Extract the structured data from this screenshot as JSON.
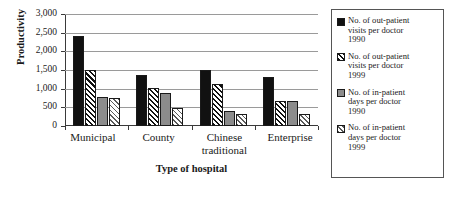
{
  "chart_data": {
    "type": "bar",
    "title": "",
    "xlabel": "Type of hospital",
    "ylabel": "Productivity",
    "categories": [
      "Municipal",
      "County",
      "Chinese traditional",
      "Enterprise"
    ],
    "category_lines": [
      [
        "Municipal"
      ],
      [
        "County"
      ],
      [
        "Chinese",
        "traditional"
      ],
      [
        "Enterprise"
      ]
    ],
    "series": [
      {
        "name": "No. of out-patient visits per doctor 1990",
        "name_lines": "No. of out-patient\nvisits per doctor\n1990",
        "fill": "solid-black",
        "color": "#111111",
        "values": [
          2400,
          1360,
          1500,
          1310
        ]
      },
      {
        "name": "No. of out-patient visits per doctor 1999",
        "name_lines": "No. of out-patient\nvisits per doctor\n1999",
        "fill": "hatch-dark",
        "color": "#111111",
        "values": [
          1500,
          1020,
          1120,
          680
        ]
      },
      {
        "name": "No. of in-patient days per doctor 1990",
        "name_lines": "No. of in-patient\ndays per doctor\n1990",
        "fill": "solid-gray",
        "color": "#8c8c8c",
        "values": [
          790,
          880,
          390,
          660
        ]
      },
      {
        "name": "No. of in-patient days per doctor 1999",
        "name_lines": "No. of in-patient\ndays per doctor\n1999",
        "fill": "hatch-light",
        "color": "#5a5a5a",
        "values": [
          750,
          480,
          330,
          320
        ]
      }
    ],
    "ylim": [
      0,
      3000
    ],
    "yticks": [
      0,
      500,
      1000,
      1500,
      2000,
      2500,
      3000
    ],
    "ytick_labels": [
      "0",
      "500",
      "1,000",
      "1,500",
      "2,000",
      "2,500",
      "3,000"
    ],
    "grid": true,
    "legend_position": "right"
  }
}
